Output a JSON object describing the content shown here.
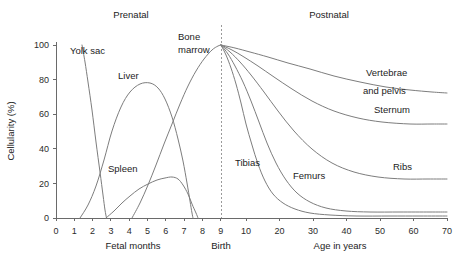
{
  "chart_data": {
    "type": "line",
    "title": "",
    "subtitle": "",
    "xlabel_prenatal": "Fetal months",
    "xlabel_postnatal": "Age in years",
    "ylabel": "Cellularity (%)",
    "ylim": [
      0,
      100
    ],
    "yticks": [
      0,
      20,
      40,
      60,
      80,
      100
    ],
    "yticklabels": [
      "0",
      "20",
      "40",
      "60",
      "80",
      "100"
    ],
    "grid": false,
    "legend_position": "inline-annotations",
    "period_labels": [
      {
        "text": "Prenatal",
        "x_px": 131,
        "y_px": 18
      },
      {
        "text": "Postnatal",
        "x_px": 329,
        "y_px": 18
      }
    ],
    "birth_marker": {
      "label": "Birth",
      "x_px": 221,
      "style": "dashed-vertical"
    },
    "axis_prenatal": {
      "ticks": [
        0,
        1,
        2,
        3,
        4,
        5,
        6,
        7,
        8,
        9
      ],
      "ticklabels": [
        "0",
        "1",
        "2",
        "3",
        "4",
        "5",
        "6",
        "7",
        "8",
        "9"
      ],
      "x_px_start": 56,
      "x_px_per_unit": 18.3
    },
    "axis_postnatal": {
      "ticks": [
        10,
        20,
        30,
        40,
        50,
        60,
        70
      ],
      "ticklabels": [
        "10",
        "20",
        "30",
        "40",
        "50",
        "60",
        "70"
      ],
      "x_px_start": 246,
      "x_px_per_unit": 3.23
    },
    "series": [
      {
        "name": "Yolk sac",
        "label_x_px": 70,
        "label_y_px": 54,
        "points_px": [
          [
            82,
            45
          ],
          [
            85,
            62
          ],
          [
            88,
            82
          ],
          [
            92,
            110
          ],
          [
            96,
            142
          ],
          [
            100,
            172
          ],
          [
            103,
            195
          ],
          [
            105,
            210
          ],
          [
            106.5,
            218
          ]
        ]
      },
      {
        "name": "Liver",
        "label_x_px": 118,
        "label_y_px": 79,
        "points_px": [
          [
            80,
            218
          ],
          [
            88,
            205
          ],
          [
            96,
            186
          ],
          [
            104,
            160
          ],
          [
            112,
            131
          ],
          [
            121,
            107
          ],
          [
            130,
            92
          ],
          [
            140,
            84
          ],
          [
            150,
            83
          ],
          [
            158,
            88
          ],
          [
            165,
            99
          ],
          [
            172,
            117
          ],
          [
            178,
            139
          ],
          [
            183,
            161
          ],
          [
            187,
            183
          ],
          [
            190,
            201
          ],
          [
            192,
            213
          ],
          [
            193,
            218
          ]
        ]
      },
      {
        "name": "Spleen",
        "label_x_px": 108,
        "label_y_px": 172,
        "points_px": [
          [
            106,
            218
          ],
          [
            114,
            211
          ],
          [
            122,
            203
          ],
          [
            130,
            196
          ],
          [
            139,
            189
          ],
          [
            148,
            184
          ],
          [
            157,
            180
          ],
          [
            165,
            178
          ],
          [
            172,
            177
          ],
          [
            178,
            179
          ],
          [
            183,
            185
          ],
          [
            188,
            194
          ],
          [
            192,
            204
          ],
          [
            196,
            213
          ],
          [
            198,
            218
          ]
        ]
      },
      {
        "name": "Bone marrow",
        "label_x_px": 178,
        "label_y_px": 40,
        "label_line2": "marrow",
        "points_px": [
          [
            132,
            218
          ],
          [
            140,
            203
          ],
          [
            148,
            185
          ],
          [
            156,
            165
          ],
          [
            164,
            144
          ],
          [
            172,
            124
          ],
          [
            180,
            104
          ],
          [
            188,
            86
          ],
          [
            196,
            71
          ],
          [
            204,
            59
          ],
          [
            212,
            50
          ],
          [
            218,
            46
          ],
          [
            221,
            45
          ]
        ]
      },
      {
        "name": "Vertebrae and pelvis",
        "label_x_px": 366,
        "label_y_px": 76,
        "label_line2": "and pelvis",
        "label2_x_px": 363,
        "label2_y_px": 94,
        "points_px": [
          [
            221,
            45
          ],
          [
            235,
            48
          ],
          [
            250,
            52
          ],
          [
            268,
            57
          ],
          [
            288,
            63
          ],
          [
            310,
            69
          ],
          [
            334,
            76
          ],
          [
            360,
            82
          ],
          [
            386,
            87
          ],
          [
            410,
            90
          ],
          [
            432,
            92
          ],
          [
            447,
            93
          ]
        ]
      },
      {
        "name": "Sternum",
        "label_x_px": 374,
        "label_y_px": 113,
        "points_px": [
          [
            221,
            45
          ],
          [
            232,
            50
          ],
          [
            244,
            57
          ],
          [
            258,
            66
          ],
          [
            274,
            77
          ],
          [
            292,
            89
          ],
          [
            312,
            101
          ],
          [
            334,
            111
          ],
          [
            358,
            118
          ],
          [
            382,
            122
          ],
          [
            410,
            124
          ],
          [
            432,
            124
          ],
          [
            447,
            124
          ]
        ]
      },
      {
        "name": "Ribs",
        "label_x_px": 393,
        "label_y_px": 170,
        "points_px": [
          [
            221,
            45
          ],
          [
            230,
            52
          ],
          [
            240,
            62
          ],
          [
            251,
            75
          ],
          [
            264,
            92
          ],
          [
            278,
            111
          ],
          [
            294,
            131
          ],
          [
            312,
            149
          ],
          [
            332,
            163
          ],
          [
            354,
            172
          ],
          [
            378,
            177
          ],
          [
            404,
            179
          ],
          [
            428,
            179
          ],
          [
            447,
            179
          ]
        ]
      },
      {
        "name": "Femurs",
        "label_x_px": 293,
        "label_y_px": 179,
        "points_px": [
          [
            221,
            45
          ],
          [
            228,
            54
          ],
          [
            235,
            66
          ],
          [
            243,
            82
          ],
          [
            251,
            101
          ],
          [
            259,
            122
          ],
          [
            267,
            143
          ],
          [
            276,
            163
          ],
          [
            286,
            180
          ],
          [
            297,
            193
          ],
          [
            310,
            202
          ],
          [
            326,
            208
          ],
          [
            346,
            211
          ],
          [
            370,
            212
          ],
          [
            400,
            212
          ],
          [
            430,
            212
          ],
          [
            447,
            212
          ]
        ]
      },
      {
        "name": "Tibias",
        "label_x_px": 235,
        "label_y_px": 166,
        "points_px": [
          [
            221,
            45
          ],
          [
            226,
            55
          ],
          [
            231,
            68
          ],
          [
            236,
            84
          ],
          [
            241,
            103
          ],
          [
            246,
            124
          ],
          [
            252,
            145
          ],
          [
            258,
            164
          ],
          [
            265,
            181
          ],
          [
            273,
            194
          ],
          [
            283,
            203
          ],
          [
            295,
            209
          ],
          [
            310,
            213
          ],
          [
            330,
            215
          ],
          [
            356,
            216
          ],
          [
            390,
            216
          ],
          [
            420,
            216
          ],
          [
            447,
            216
          ]
        ]
      }
    ],
    "values_at_age_70": {
      "Vertebrae and pelvis": 72,
      "Sternum": 55,
      "Ribs": 23,
      "Femurs": 4,
      "Tibias": 1
    },
    "prenatal_peaks": {
      "Yolk sac": {
        "peak_percent": 100,
        "peak_month": 1.4
      },
      "Liver": {
        "peak_percent": 75,
        "peak_month": 5.1
      },
      "Spleen": {
        "peak_percent": 24,
        "peak_month": 5.4
      },
      "Bone marrow": {
        "peak_percent": 100,
        "peak_month": 9.5
      }
    }
  },
  "geometry": {
    "plot_left_px": 56,
    "plot_right_px": 447,
    "plot_top_px": 45,
    "plot_bottom_px": 218,
    "y_axis_x_px": 56,
    "ylabel_x_px": 14,
    "ylabel_y_px": 131,
    "xlabel_prenatal_x_px": 133,
    "xlabel_prenatal_y_px": 249,
    "xlabel_postnatal_x_px": 340,
    "xlabel_postnatal_y_px": 249,
    "birth_label_x_px": 221,
    "birth_label_y_px": 249,
    "xtick_label_y_px": 234,
    "ytick_positions_px": [
      218,
      183.4,
      148.8,
      114.2,
      79.6,
      45
    ]
  }
}
